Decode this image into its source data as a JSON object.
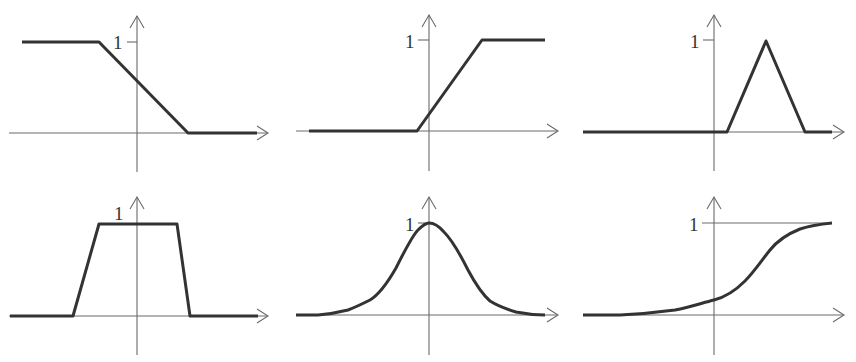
{
  "figure": {
    "colors": {
      "curve": "#333333",
      "axis": "#6a6a6a",
      "background": "#ffffff"
    },
    "panels": [
      {
        "id": "left-shoulder",
        "row": 1,
        "col": 1,
        "one_label": "1",
        "shape": "decreasing ramp (Z / left shoulder)",
        "points": [
          [
            -1.55,
            1
          ],
          [
            -0.5,
            1
          ],
          [
            0.7,
            0
          ],
          [
            1.6,
            0
          ]
        ]
      },
      {
        "id": "right-shoulder",
        "row": 1,
        "col": 2,
        "one_label": "1",
        "shape": "increasing ramp (S / right shoulder)",
        "points": [
          [
            -1.6,
            0
          ],
          [
            -0.15,
            0
          ],
          [
            0.7,
            1
          ],
          [
            1.6,
            1
          ]
        ]
      },
      {
        "id": "triangular",
        "row": 1,
        "col": 3,
        "one_label": "1",
        "shape": "triangle",
        "points": [
          [
            -1.75,
            0
          ],
          [
            0.17,
            0
          ],
          [
            0.7,
            1
          ],
          [
            1.2,
            0
          ],
          [
            1.6,
            0
          ]
        ]
      },
      {
        "id": "trapezoidal",
        "row": 2,
        "col": 1,
        "one_label": "1",
        "shape": "trapezoid",
        "points": [
          [
            -1.7,
            0
          ],
          [
            -0.85,
            0
          ],
          [
            -0.5,
            1
          ],
          [
            0.55,
            1
          ],
          [
            0.72,
            0
          ],
          [
            1.6,
            0
          ]
        ]
      },
      {
        "id": "gaussian",
        "row": 2,
        "col": 2,
        "one_label": "1",
        "shape": "gaussian bell curve",
        "peak_x": 0
      },
      {
        "id": "sigmoid",
        "row": 2,
        "col": 3,
        "one_label": "1",
        "shape": "sigmoid with asymptote line at 1"
      }
    ]
  }
}
